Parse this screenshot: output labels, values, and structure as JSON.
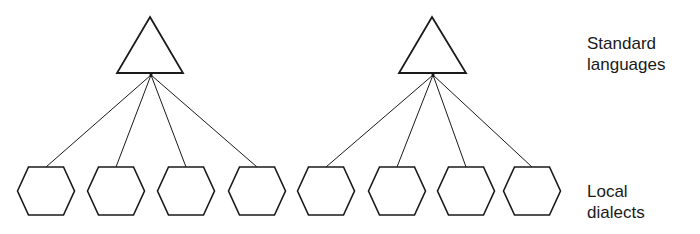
{
  "diagram": {
    "type": "hierarchy",
    "colors": {
      "stroke": "#1a1a1a",
      "background": "#ffffff"
    },
    "standards": [
      {
        "shape": "triangle",
        "apex": [
          150,
          17
        ],
        "base_y": 73,
        "base_x": [
          117,
          183
        ],
        "children": [
          0,
          1,
          2,
          3
        ]
      },
      {
        "shape": "triangle",
        "apex": [
          432,
          17
        ],
        "base_y": 73,
        "base_x": [
          399,
          466
        ],
        "children": [
          4,
          5,
          6,
          7
        ]
      }
    ],
    "dialects": [
      {
        "shape": "hexagon",
        "cx": 46
      },
      {
        "shape": "hexagon",
        "cx": 116
      },
      {
        "shape": "hexagon",
        "cx": 186
      },
      {
        "shape": "hexagon",
        "cx": 257
      },
      {
        "shape": "hexagon",
        "cx": 326
      },
      {
        "shape": "hexagon",
        "cx": 397
      },
      {
        "shape": "hexagon",
        "cx": 466
      },
      {
        "shape": "hexagon",
        "cx": 532
      }
    ],
    "hexagon_cy": 191
  },
  "labels": {
    "standard_line1": "Standard",
    "standard_line2": "languages",
    "local_line1": "Local",
    "local_line2": "dialects"
  }
}
